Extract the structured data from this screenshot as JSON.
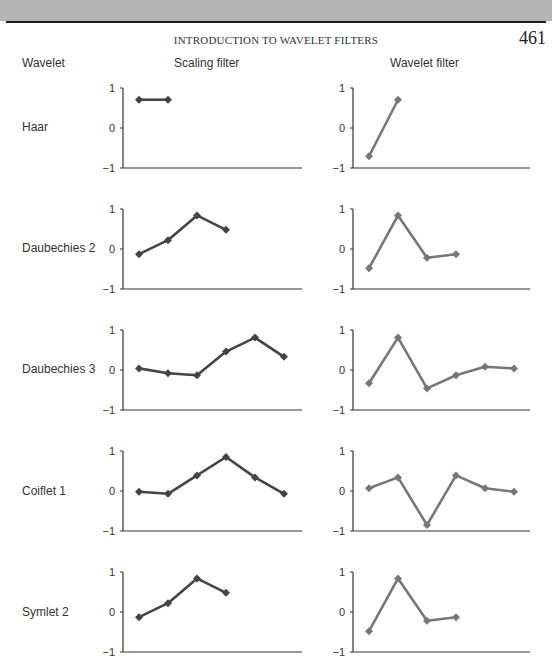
{
  "header": {
    "running_head": "INTRODUCTION TO WAVELET FILTERS",
    "page_number": "461"
  },
  "columns": {
    "wavelet": "Wavelet",
    "scaling": "Scaling filter",
    "wavelet_filter": "Wavelet filter"
  },
  "colors": {
    "scaling_line": "#444444",
    "wavelet_line": "#777777",
    "axis": "#333333",
    "header_band": "#b4b4b4"
  },
  "chart_data": [
    {
      "type": "line",
      "title": "Haar — Scaling filter",
      "series": [
        {
          "name": "Scaling filter",
          "values": [
            0.707,
            0.707
          ]
        }
      ],
      "x": [
        1,
        2
      ],
      "ylim": [
        -1,
        1
      ],
      "yticks": [
        1,
        0,
        -1
      ],
      "ytick_labels": [
        "1",
        "0",
        "−1"
      ],
      "grid": false
    },
    {
      "type": "line",
      "title": "Haar — Wavelet filter",
      "series": [
        {
          "name": "Wavelet filter",
          "values": [
            -0.707,
            0.707
          ]
        }
      ],
      "x": [
        1,
        2
      ],
      "ylim": [
        -1,
        1
      ],
      "yticks": [
        1,
        0,
        -1
      ],
      "ytick_labels": [
        "1",
        "0",
        "−1"
      ],
      "grid": false
    },
    {
      "type": "line",
      "title": "Daubechies 2 — Scaling filter",
      "series": [
        {
          "name": "Scaling filter",
          "values": [
            -0.13,
            0.22,
            0.84,
            0.48
          ]
        }
      ],
      "x": [
        1,
        2,
        3,
        4
      ],
      "ylim": [
        -1,
        1
      ],
      "yticks": [
        1,
        0,
        -1
      ],
      "ytick_labels": [
        "1",
        "0",
        "−1"
      ],
      "grid": false
    },
    {
      "type": "line",
      "title": "Daubechies 2 — Wavelet filter",
      "series": [
        {
          "name": "Wavelet filter",
          "values": [
            -0.48,
            0.84,
            -0.22,
            -0.13
          ]
        }
      ],
      "x": [
        1,
        2,
        3,
        4
      ],
      "ylim": [
        -1,
        1
      ],
      "yticks": [
        1,
        0,
        -1
      ],
      "ytick_labels": [
        "1",
        "0",
        "−1"
      ],
      "grid": false
    },
    {
      "type": "line",
      "title": "Daubechies 3 — Scaling filter",
      "series": [
        {
          "name": "Scaling filter",
          "values": [
            0.04,
            -0.08,
            -0.13,
            0.46,
            0.81,
            0.33
          ]
        }
      ],
      "x": [
        1,
        2,
        3,
        4,
        5,
        6
      ],
      "ylim": [
        -1,
        1
      ],
      "yticks": [
        1,
        0,
        -1
      ],
      "ytick_labels": [
        "1",
        "0",
        "−1"
      ],
      "grid": false
    },
    {
      "type": "line",
      "title": "Daubechies 3 — Wavelet filter",
      "series": [
        {
          "name": "Wavelet filter",
          "values": [
            -0.33,
            0.81,
            -0.46,
            -0.13,
            0.08,
            0.04
          ]
        }
      ],
      "x": [
        1,
        2,
        3,
        4,
        5,
        6
      ],
      "ylim": [
        -1,
        1
      ],
      "yticks": [
        1,
        0,
        -1
      ],
      "ytick_labels": [
        "1",
        "0",
        "−1"
      ],
      "grid": false
    },
    {
      "type": "line",
      "title": "Coiflet 1 — Scaling filter",
      "series": [
        {
          "name": "Scaling filter",
          "values": [
            -0.02,
            -0.07,
            0.39,
            0.85,
            0.34,
            -0.07
          ]
        }
      ],
      "x": [
        1,
        2,
        3,
        4,
        5,
        6
      ],
      "ylim": [
        -1,
        1
      ],
      "yticks": [
        1,
        0,
        -1
      ],
      "ytick_labels": [
        "1",
        "0",
        "−1"
      ],
      "grid": false
    },
    {
      "type": "line",
      "title": "Coiflet 1 — Wavelet filter",
      "series": [
        {
          "name": "Wavelet filter",
          "values": [
            0.07,
            0.34,
            -0.85,
            0.39,
            0.07,
            -0.02
          ]
        }
      ],
      "x": [
        1,
        2,
        3,
        4,
        5,
        6
      ],
      "ylim": [
        -1,
        1
      ],
      "yticks": [
        1,
        0,
        -1
      ],
      "ytick_labels": [
        "1",
        "0",
        "−1"
      ],
      "grid": false
    },
    {
      "type": "line",
      "title": "Symlet 2 — Scaling filter",
      "series": [
        {
          "name": "Scaling filter",
          "values": [
            -0.13,
            0.22,
            0.84,
            0.48
          ]
        }
      ],
      "x": [
        1,
        2,
        3,
        4
      ],
      "ylim": [
        -1,
        1
      ],
      "yticks": [
        1,
        0,
        -1
      ],
      "ytick_labels": [
        "1",
        "0",
        "−1"
      ],
      "grid": false
    },
    {
      "type": "line",
      "title": "Symlet 2 — Wavelet filter",
      "series": [
        {
          "name": "Wavelet filter",
          "values": [
            -0.48,
            0.84,
            -0.22,
            -0.13
          ]
        }
      ],
      "x": [
        1,
        2,
        3,
        4
      ],
      "ylim": [
        -1,
        1
      ],
      "yticks": [
        1,
        0,
        -1
      ],
      "ytick_labels": [
        "1",
        "0",
        "−1"
      ],
      "grid": false
    }
  ],
  "rows": [
    {
      "label": "Haar"
    },
    {
      "label": "Daubechies 2"
    },
    {
      "label": "Daubechies 3"
    },
    {
      "label": "Coiflet 1"
    },
    {
      "label": "Symlet 2"
    }
  ]
}
